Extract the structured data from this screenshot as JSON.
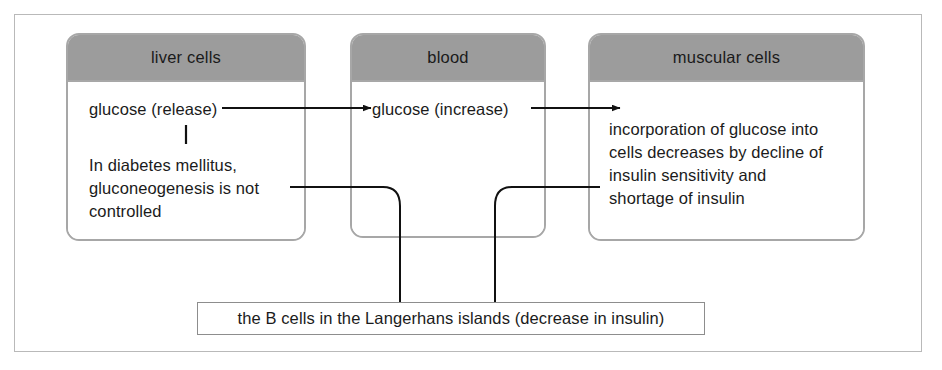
{
  "diagram": {
    "frame_color": "#b9b9b9",
    "header_fill": "#9c9c9c",
    "box_border_color": "#a7a7a7",
    "connector_color": "#111111",
    "compartments": [
      {
        "id": "liver-cells",
        "header": "liver cells",
        "primary_text": "glucose (release)",
        "secondary_text": "In diabetes mellitus,\ngluconeogenesis is not\ncontrolled"
      },
      {
        "id": "blood",
        "header": "blood",
        "primary_text": "glucose (increase)"
      },
      {
        "id": "muscular-cells",
        "header": "muscular cells",
        "primary_text": "incorporation of glucose into\ncells decreases by decline of\ninsulin sensitivity and\nshortage of insulin"
      }
    ],
    "note": {
      "id": "langerhans-note",
      "text": "the B cells in the Langerhans islands (decrease in insulin)"
    }
  }
}
